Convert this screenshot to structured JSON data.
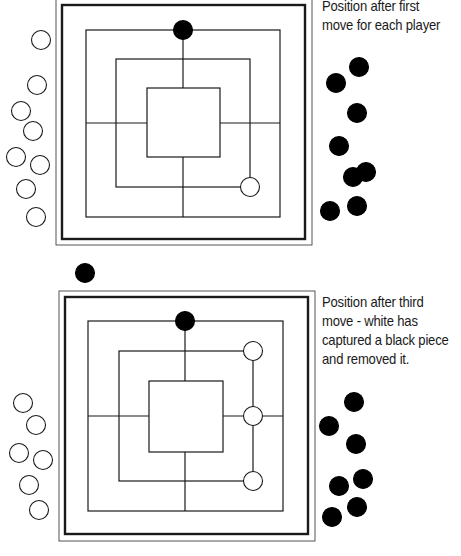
{
  "diagrams": [
    {
      "caption_lines": [
        "Position after first",
        "move for each player"
      ],
      "board": {
        "frame_outer": [
          56,
          -2,
          312,
          245
        ],
        "frame_inner": [
          62,
          5,
          305,
          239
        ],
        "squares": [
          [
            86,
            30,
            280,
            217
          ],
          [
            116,
            59,
            250,
            187
          ],
          [
            147,
            88,
            220,
            157
          ]
        ],
        "center": [
          183,
          123
        ]
      },
      "pieces_on_board": [
        {
          "color": "black",
          "x": 183,
          "y": 30
        },
        {
          "color": "white",
          "x": 250,
          "y": 187
        }
      ],
      "white_reserve": [
        [
          41,
          40
        ],
        [
          37,
          85
        ],
        [
          21,
          111
        ],
        [
          33,
          131
        ],
        [
          16,
          157
        ],
        [
          40,
          165
        ],
        [
          26,
          189
        ],
        [
          36,
          217
        ]
      ],
      "black_reserve": [
        [
          359,
          67
        ],
        [
          336,
          83
        ],
        [
          357,
          113
        ],
        [
          339,
          146
        ],
        [
          353,
          177
        ],
        [
          366,
          172
        ],
        [
          330,
          211
        ],
        [
          357,
          206
        ]
      ]
    },
    {
      "caption_lines": [
        "Position after third",
        "move - white has",
        "captured a black piece",
        "and removed it."
      ],
      "board": {
        "frame_outer": [
          59,
          291,
          315,
          541
        ],
        "frame_inner": [
          65,
          297,
          308,
          534
        ],
        "squares": [
          [
            88,
            321,
            283,
            511
          ],
          [
            119,
            351,
            253,
            481
          ],
          [
            149,
            381,
            223,
            452
          ]
        ],
        "center": [
          185,
          416
        ]
      },
      "pieces_on_board": [
        {
          "color": "black",
          "x": 185,
          "y": 321
        },
        {
          "color": "white",
          "x": 253,
          "y": 351
        },
        {
          "color": "white",
          "x": 253,
          "y": 416
        },
        {
          "color": "white",
          "x": 253,
          "y": 481
        }
      ],
      "captured_piece": {
        "color": "black",
        "x": 85,
        "y": 273
      },
      "white_reserve": [
        [
          23,
          403
        ],
        [
          36,
          425
        ],
        [
          19,
          453
        ],
        [
          43,
          460
        ],
        [
          29,
          485
        ],
        [
          39,
          510
        ]
      ],
      "black_reserve": [
        [
          354,
          402
        ],
        [
          329,
          426
        ],
        [
          356,
          444
        ],
        [
          363,
          479
        ],
        [
          339,
          486
        ],
        [
          357,
          507
        ],
        [
          332,
          517
        ]
      ]
    }
  ],
  "colors": {
    "line": "#1a1a1a",
    "black_piece": "#000000",
    "white_piece": "#ffffff",
    "frame_outer": "#555555"
  }
}
